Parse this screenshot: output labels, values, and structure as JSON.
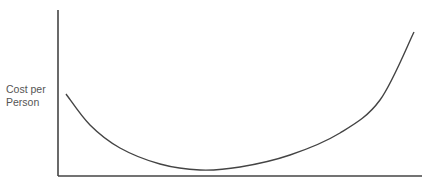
{
  "chart_data": {
    "type": "line",
    "title": "",
    "xlabel": "",
    "ylabel": "Cost per Person",
    "ylabel_lines": [
      "Cost per",
      "Person"
    ],
    "grid": false,
    "legend": null,
    "x_ticks": [],
    "y_ticks": [],
    "series": [
      {
        "name": "cost",
        "color": "#444444",
        "points_px": [
          [
            66,
            94
          ],
          [
            90,
            125
          ],
          [
            120,
            148
          ],
          [
            160,
            164
          ],
          [
            200,
            170
          ],
          [
            240,
            167
          ],
          [
            290,
            155
          ],
          [
            340,
            133
          ],
          [
            380,
            100
          ],
          [
            414,
            32
          ]
        ]
      }
    ],
    "axes_px": {
      "origin": [
        58,
        176
      ],
      "y_top": 10,
      "x_right": 422
    }
  },
  "colors": {
    "axis": "#444444",
    "curve": "#444444",
    "label": "#555555"
  }
}
